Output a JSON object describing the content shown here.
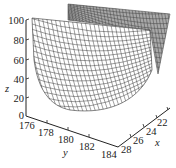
{
  "chart_data": {
    "type": "surface3d",
    "title": "",
    "xlabel": "x",
    "ylabel": "y",
    "zlabel": "z",
    "x_ticks": [
      22,
      24,
      26,
      28
    ],
    "y_ticks": [
      176,
      178,
      180,
      182,
      184
    ],
    "z_ticks": [
      0,
      20,
      40,
      60,
      80,
      100
    ],
    "xlim": [
      21,
      28
    ],
    "ylim": [
      176,
      184
    ],
    "zlim": [
      0,
      100
    ],
    "grid": false,
    "legend": null
  },
  "labels": {
    "z_ticks": [
      "100",
      "80",
      "60",
      "40",
      "20",
      "0"
    ],
    "y_ticks": [
      "176",
      "178",
      "180",
      "182",
      "184"
    ],
    "x_ticks": [
      "22",
      "24",
      "26",
      "28"
    ],
    "z_axis": "z",
    "y_axis": "y",
    "x_axis": "x"
  },
  "colors": {
    "mesh_line": "#2a2a2a",
    "back_face": "#9a9a9a",
    "axis": "#222222"
  }
}
